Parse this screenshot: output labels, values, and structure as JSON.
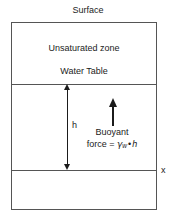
{
  "figure": {
    "type": "hydrogeology-cross-section",
    "background_color": "#ffffff",
    "line_color": "#555555",
    "text_color": "#1b1b1b"
  },
  "labels": {
    "surface": "Surface",
    "unsaturated_zone": "Unsaturated zone",
    "water_table": "Water Table",
    "h": "h",
    "x_axis": "x",
    "buoyant_line1": "Buoyant",
    "buoyant_line2_prefix": "force =",
    "gamma_symbol": "γ",
    "gamma_subscript": "w",
    "multiply_symbol": "•",
    "depth_variable": "h"
  },
  "chart_data": {
    "type": "diagram",
    "regions": [
      {
        "name": "Unsaturated zone",
        "top": 22,
        "bottom": 84
      },
      {
        "name": "Saturated zone (depth h)",
        "top": 84,
        "bottom": 170
      },
      {
        "name": "Lower zone",
        "top": 170,
        "bottom": 210
      }
    ],
    "boundaries": [
      {
        "name": "Surface",
        "y": 22
      },
      {
        "name": "Water Table",
        "y": 84
      },
      {
        "name": "x datum",
        "y": 170
      }
    ],
    "annotations": [
      {
        "name": "h",
        "kind": "double-headed-dimension-arrow",
        "from_y": 84,
        "to_y": 170,
        "x": 67
      },
      {
        "name": "Buoyant force",
        "kind": "single-headed-arrow-up",
        "from_y": 126,
        "to_y": 98,
        "x": 112
      }
    ],
    "equation": "force = γ_w • h"
  }
}
